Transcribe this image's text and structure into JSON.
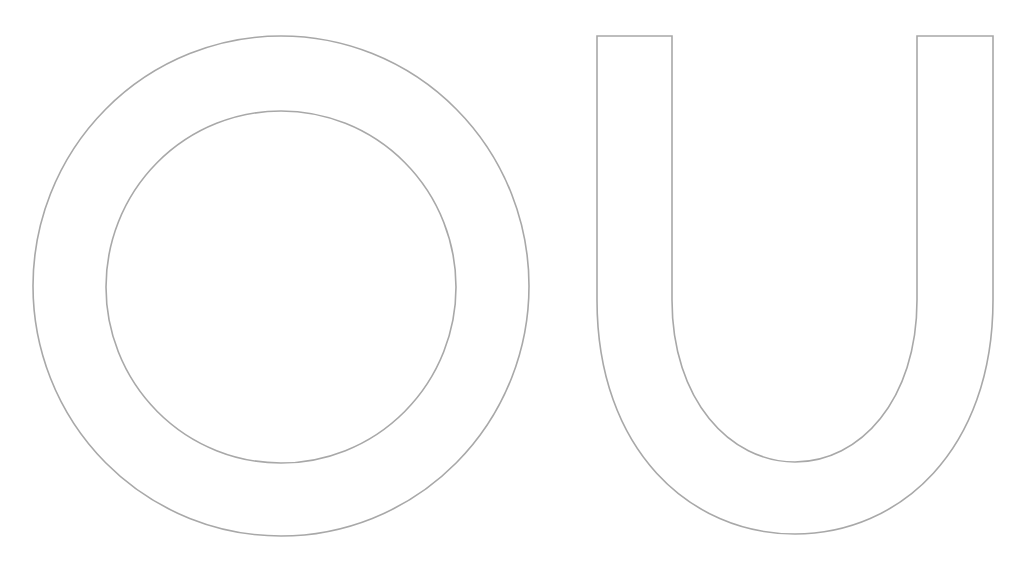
{
  "letters": [
    {
      "char": "O",
      "style": "outline"
    },
    {
      "char": "U",
      "style": "outline"
    }
  ],
  "colors": {
    "stroke": "#a8a8a8",
    "background": "#ffffff"
  }
}
